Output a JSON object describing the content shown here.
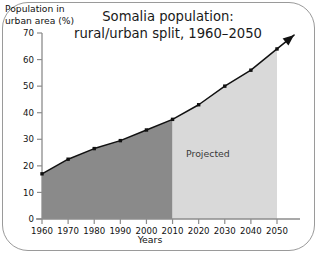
{
  "chart_data": {
    "type": "area",
    "title": "Somalia population:\nrural/urban split, 1960–2050",
    "title_line1": "Somalia population:",
    "title_line2": "rural/urban split, 1960–2050",
    "xlabel": "Years",
    "ylabel": "Population in\nurban area (%)",
    "ylabel_line1": "Population in",
    "ylabel_line2": "urban area (%)",
    "x": [
      1960,
      1970,
      1980,
      1990,
      2000,
      2010,
      2020,
      2030,
      2040,
      2050
    ],
    "values": [
      17,
      22.5,
      26.5,
      29.5,
      33.5,
      37.5,
      43,
      50,
      56,
      64
    ],
    "xticklabels": [
      "1960",
      "1970",
      "1980",
      "1990",
      "2000",
      "2010",
      "2020",
      "2030",
      "2040",
      "2050"
    ],
    "yticklabels": [
      "0",
      "10",
      "20",
      "30",
      "40",
      "50",
      "60",
      "70"
    ],
    "yticks": [
      0,
      10,
      20,
      30,
      40,
      50,
      60,
      70
    ],
    "xlim": [
      1960,
      2050
    ],
    "ylim": [
      0,
      70
    ],
    "grid": false,
    "legend": "none",
    "annotations": [
      {
        "text": "Projected",
        "x": 2028,
        "y": 21
      }
    ],
    "regions": [
      {
        "name": "historical",
        "from": 1960,
        "to": 2010,
        "color": "#8a8a8a"
      },
      {
        "name": "projected",
        "from": 2010,
        "to": 2050,
        "color": "#d9d9d9",
        "label": "Projected"
      }
    ],
    "series_color": "#111111",
    "marker": "square",
    "arrow_end": true
  },
  "colors": {
    "historical_fill": "#8a8a8a",
    "projected_fill": "#d9d9d9",
    "line": "#111111",
    "axis": "#8c8c8c",
    "frame": "#9a9a9a",
    "text": "#111111"
  }
}
